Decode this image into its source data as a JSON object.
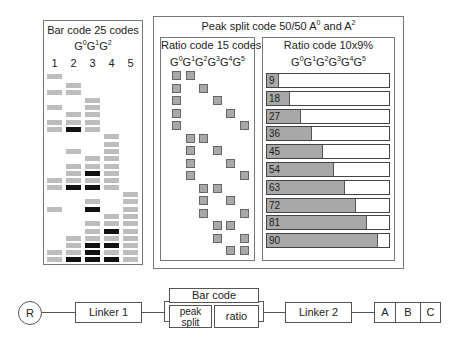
{
  "barcode_panel": {
    "title": "Bar code 25 codes",
    "formula": [
      "G",
      "0",
      "G",
      "1",
      "G",
      "2"
    ],
    "columns": [
      "1",
      "2",
      "3",
      "4",
      "5"
    ],
    "rows": [
      {
        "y": 74,
        "cells": [
          [
            1,
            "g"
          ]
        ]
      },
      {
        "y": 83,
        "cells": [
          [
            2,
            "g"
          ]
        ]
      },
      {
        "y": 90,
        "cells": [
          [
            1,
            "g"
          ],
          [
            2,
            "g"
          ]
        ]
      },
      {
        "y": 98,
        "cells": [
          [
            3,
            "g"
          ]
        ]
      },
      {
        "y": 105,
        "cells": [
          [
            1,
            "g"
          ],
          [
            3,
            "g"
          ]
        ]
      },
      {
        "y": 112,
        "cells": [
          [
            2,
            "g"
          ],
          [
            3,
            "g"
          ]
        ]
      },
      {
        "y": 120,
        "cells": [
          [
            1,
            "g"
          ],
          [
            2,
            "g"
          ],
          [
            3,
            "g"
          ]
        ]
      },
      {
        "y": 127,
        "cells": [
          [
            1,
            "g"
          ],
          [
            2,
            "b"
          ],
          [
            3,
            "g"
          ]
        ]
      },
      {
        "y": 134,
        "cells": [
          [
            4,
            "g"
          ]
        ]
      },
      {
        "y": 142,
        "cells": [
          [
            4,
            "g"
          ]
        ]
      },
      {
        "y": 149,
        "cells": [
          [
            2,
            "g"
          ],
          [
            4,
            "g"
          ]
        ]
      },
      {
        "y": 156,
        "cells": [
          [
            3,
            "g"
          ],
          [
            4,
            "g"
          ]
        ]
      },
      {
        "y": 164,
        "cells": [
          [
            2,
            "g"
          ],
          [
            3,
            "g"
          ],
          [
            4,
            "g"
          ]
        ]
      },
      {
        "y": 171,
        "cells": [
          [
            2,
            "g"
          ],
          [
            3,
            "b"
          ],
          [
            4,
            "g"
          ]
        ]
      },
      {
        "y": 178,
        "cells": [
          [
            1,
            "g"
          ],
          [
            2,
            "g"
          ],
          [
            3,
            "g"
          ],
          [
            4,
            "g"
          ]
        ]
      },
      {
        "y": 185,
        "cells": [
          [
            1,
            "g"
          ],
          [
            2,
            "b"
          ],
          [
            3,
            "b"
          ],
          [
            4,
            "g"
          ]
        ]
      },
      {
        "y": 192,
        "cells": [
          [
            5,
            "g"
          ]
        ]
      },
      {
        "y": 199,
        "cells": [
          [
            3,
            "g"
          ],
          [
            5,
            "g"
          ]
        ]
      },
      {
        "y": 207,
        "cells": [
          [
            1,
            "g"
          ],
          [
            3,
            "b"
          ],
          [
            5,
            "g"
          ]
        ]
      },
      {
        "y": 214,
        "cells": [
          [
            4,
            "g"
          ],
          [
            5,
            "g"
          ]
        ]
      },
      {
        "y": 221,
        "cells": [
          [
            3,
            "g"
          ],
          [
            4,
            "g"
          ],
          [
            5,
            "g"
          ]
        ]
      },
      {
        "y": 229,
        "cells": [
          [
            3,
            "g"
          ],
          [
            4,
            "b"
          ],
          [
            5,
            "g"
          ]
        ]
      },
      {
        "y": 236,
        "cells": [
          [
            2,
            "g"
          ],
          [
            3,
            "g"
          ],
          [
            4,
            "g"
          ],
          [
            5,
            "g"
          ]
        ]
      },
      {
        "y": 243,
        "cells": [
          [
            2,
            "g"
          ],
          [
            3,
            "b"
          ],
          [
            4,
            "b"
          ],
          [
            5,
            "g"
          ]
        ]
      },
      {
        "y": 250,
        "cells": [
          [
            1,
            "g"
          ],
          [
            2,
            "g"
          ],
          [
            3,
            "b"
          ],
          [
            4,
            "g"
          ],
          [
            5,
            "g"
          ]
        ]
      },
      {
        "y": 257,
        "cells": [
          [
            1,
            "g"
          ],
          [
            2,
            "b"
          ],
          [
            3,
            "b"
          ],
          [
            4,
            "b"
          ],
          [
            5,
            "g"
          ]
        ]
      }
    ]
  },
  "peak_split_panel": {
    "title_parts": [
      "Peak split code 50/50 A",
      "0",
      " and A",
      "2"
    ],
    "ratio15": {
      "title": "Ratio code 15 codes",
      "formula": [
        "G",
        "0",
        "G",
        "1",
        "G",
        "2",
        "G",
        "3",
        "G",
        "4",
        "G",
        "5"
      ],
      "pairs": [
        [
          0,
          1
        ],
        [
          0,
          2
        ],
        [
          0,
          3
        ],
        [
          0,
          4
        ],
        [
          0,
          5
        ],
        [
          1,
          2
        ],
        [
          1,
          3
        ],
        [
          1,
          4
        ],
        [
          1,
          5
        ],
        [
          2,
          3
        ],
        [
          2,
          4
        ],
        [
          2,
          5
        ],
        [
          3,
          4
        ],
        [
          3,
          5
        ],
        [
          4,
          5
        ]
      ]
    },
    "ratio10": {
      "title": "Ratio code 10x9%",
      "formula": [
        "G",
        "0",
        "G",
        "1",
        "G",
        "2",
        "G",
        "3",
        "G",
        "4",
        "G",
        "5"
      ],
      "bars": [
        {
          "label": "9",
          "pct": 9
        },
        {
          "label": "18",
          "pct": 18
        },
        {
          "label": "27",
          "pct": 27
        },
        {
          "label": "36",
          "pct": 36
        },
        {
          "label": "45",
          "pct": 45
        },
        {
          "label": "54",
          "pct": 54
        },
        {
          "label": "63",
          "pct": 63
        },
        {
          "label": "72",
          "pct": 72
        },
        {
          "label": "81",
          "pct": 81
        },
        {
          "label": "90",
          "pct": 90
        }
      ]
    }
  },
  "construct": {
    "resin": "R",
    "linker1": "Linker 1",
    "barcode": "Bar code",
    "peak_split": "peak split",
    "ratio": "ratio",
    "linker2": "Linker 2",
    "a": "A",
    "b": "B",
    "c": "C"
  },
  "colors": {
    "gray_cell": "#bdbdbd",
    "black_cell": "#111111",
    "square": "#a9a9a9",
    "bar_fill": "#a8a8a8"
  }
}
